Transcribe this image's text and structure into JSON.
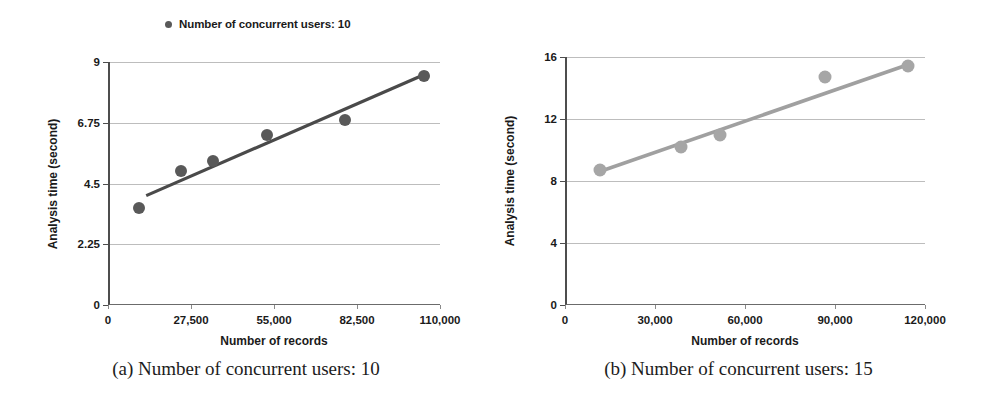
{
  "figure": {
    "panels": [
      {
        "id": "a",
        "caption": "(a) Number of concurrent users: 10",
        "legend_label": "Number of concurrent users: 10",
        "legend_marker_color": "#595959",
        "chart_data": {
          "type": "scatter",
          "title": "",
          "legend": [
            "Number of concurrent users: 10"
          ],
          "legend_position": "top-center",
          "grid": true,
          "xlabel": "Number of records",
          "ylabel": "Analysis time (second)",
          "xlim": [
            0,
            110000
          ],
          "ylim": [
            0,
            9
          ],
          "xticks": [
            0,
            27500,
            55000,
            82500,
            110000
          ],
          "xtick_labels": [
            "0",
            "27,500",
            "55,000",
            "82,500",
            "110,000"
          ],
          "yticks": [
            0,
            2.25,
            4.5,
            6.75,
            9
          ],
          "ytick_labels": [
            "0",
            "2.25",
            "4.5",
            "6.75",
            "9"
          ],
          "series": [
            {
              "name": "Number of concurrent users: 10",
              "color": "#595959",
              "x": [
                9500,
                23500,
                34000,
                52000,
                78000,
                104000
              ],
              "y": [
                3.6,
                4.95,
                5.35,
                6.3,
                6.85,
                8.5
              ]
            }
          ],
          "trendline": {
            "color": "#4a4a4a",
            "x": [
              12000,
              105500
            ],
            "y": [
              4.05,
              8.6
            ]
          }
        }
      },
      {
        "id": "b",
        "caption": "(b) Number of concurrent users: 15",
        "legend_label": "Number of concurrent users: 15",
        "legend_marker_color": "#a6a6a6",
        "chart_data": {
          "type": "scatter",
          "title": "",
          "legend": [
            "Number of concurrent users: 15"
          ],
          "legend_position": "top-center",
          "grid": true,
          "xlabel": "Number of records",
          "ylabel": "Analysis time (second)",
          "xlim": [
            0,
            120000
          ],
          "ylim": [
            0,
            16
          ],
          "xticks": [
            0,
            30000,
            60000,
            90000,
            120000
          ],
          "xtick_labels": [
            "0",
            "30,000",
            "60,000",
            "90,000",
            "120,000"
          ],
          "yticks": [
            0,
            4,
            8,
            12,
            16
          ],
          "ytick_labels": [
            "0",
            "4",
            "8",
            "12",
            "16"
          ],
          "series": [
            {
              "name": "Number of concurrent users: 15",
              "color": "#a6a6a6",
              "x": [
                11000,
                38000,
                51000,
                86000,
                113500
              ],
              "y": [
                8.7,
                10.2,
                11.0,
                14.7,
                15.4
              ]
            }
          ],
          "trendline": {
            "color": "#a0a0a0",
            "x": [
              10000,
              115000
            ],
            "y": [
              8.55,
              15.6
            ]
          }
        }
      }
    ]
  }
}
